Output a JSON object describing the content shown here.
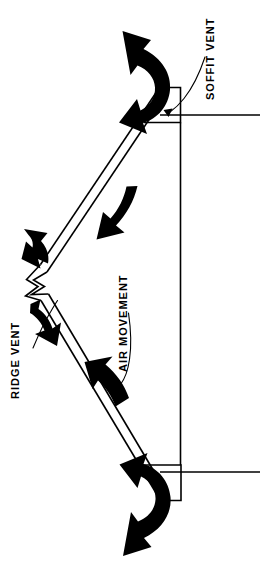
{
  "diagram": {
    "orientation": "rotated-90-ccw",
    "background_color": "#ffffff",
    "ink_color": "#000000",
    "labels": {
      "ridge_vent": "RIDGE VENT",
      "soffit_vent": "SOFFIT VENT",
      "air_movement": "AIR MOVEMENT"
    },
    "label_font_size_px": 11,
    "label_rotation_deg": -90,
    "structure": {
      "roof_peak_label": "RIDGE VENT",
      "eave_label": "SOFFIT VENT",
      "airflow_label": "AIR MOVEMENT",
      "roof_stroke_width": 1.6,
      "wall_stroke_width": 1.6,
      "leader_stroke_width": 1.1
    },
    "arrows": {
      "intake_top_name": "soffit-intake-arrow-top",
      "intake_bottom_name": "soffit-intake-arrow-bottom",
      "rafter_upper_name": "rafter-flow-arrow-upper",
      "rafter_lower_name": "rafter-flow-arrow-lower",
      "exhaust_upper_name": "ridge-exhaust-arrow-upper",
      "exhaust_lower_name": "ridge-exhaust-arrow-lower",
      "count": 6,
      "fill": "#000000"
    }
  }
}
